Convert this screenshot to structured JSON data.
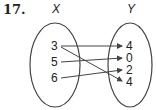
{
  "problem_number": "17.",
  "domain_set": {
    "label": "X",
    "elements": [
      "3",
      "5",
      "6"
    ]
  },
  "range_set": {
    "label": "Y",
    "elements": [
      "4",
      "0",
      "2",
      "4"
    ]
  },
  "mappings": [
    {
      "from": "3",
      "to": "4",
      "to_index": 0
    },
    {
      "from": "3",
      "to": "4",
      "to_index": 3
    },
    {
      "from": "5",
      "to": "0",
      "to_index": 1
    },
    {
      "from": "6",
      "to": "2",
      "to_index": 2
    }
  ]
}
